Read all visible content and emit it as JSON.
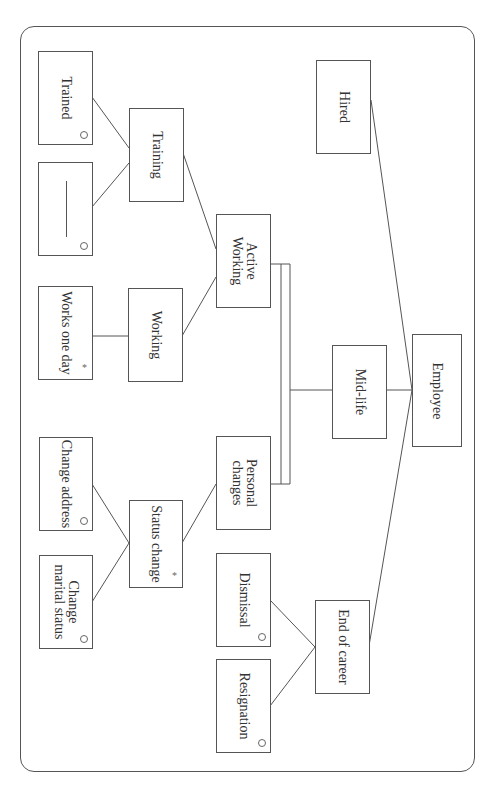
{
  "diagram": {
    "type": "jackson-structure-diagram",
    "orientation": "rotated-90-clockwise",
    "nodes": {
      "employee": {
        "label": "Employee",
        "marker": ""
      },
      "hired": {
        "label": "Hired",
        "marker": ""
      },
      "mid_life": {
        "label": "Mid-life",
        "marker": ""
      },
      "end_of_career": {
        "label": "End of career",
        "marker": ""
      },
      "active_working": {
        "label": "Active\nWorking",
        "marker": ""
      },
      "personal_changes": {
        "label": "Personal\nchanges",
        "marker": ""
      },
      "training": {
        "label": "Training",
        "marker": ""
      },
      "working": {
        "label": "Working",
        "marker": ""
      },
      "status_change": {
        "label": "Status change",
        "marker": "*"
      },
      "trained": {
        "label": "Trained",
        "marker": "o"
      },
      "not_trained": {
        "label": "",
        "marker": "o",
        "blank_line": true
      },
      "works_one_day": {
        "label": "Works one day",
        "marker": "*"
      },
      "change_address": {
        "label": "Change address",
        "marker": "o"
      },
      "change_marital_status": {
        "label": "Change\nmarital status",
        "marker": "o"
      },
      "dismissal": {
        "label": "Dismissal",
        "marker": "o"
      },
      "resignation": {
        "label": "Resignation",
        "marker": "o"
      }
    },
    "edges": [
      [
        "employee",
        "hired"
      ],
      [
        "employee",
        "mid_life"
      ],
      [
        "employee",
        "end_of_career"
      ],
      [
        "mid_life",
        "active_working"
      ],
      [
        "mid_life",
        "personal_changes"
      ],
      [
        "active_working",
        "training"
      ],
      [
        "active_working",
        "working"
      ],
      [
        "training",
        "trained"
      ],
      [
        "training",
        "not_trained"
      ],
      [
        "working",
        "works_one_day"
      ],
      [
        "personal_changes",
        "status_change"
      ],
      [
        "status_change",
        "change_address"
      ],
      [
        "status_change",
        "change_marital_status"
      ],
      [
        "end_of_career",
        "dismissal"
      ],
      [
        "end_of_career",
        "resignation"
      ]
    ],
    "parallel_bracket": {
      "between": [
        "active_working",
        "personal_changes"
      ],
      "parent": "mid_life"
    }
  }
}
